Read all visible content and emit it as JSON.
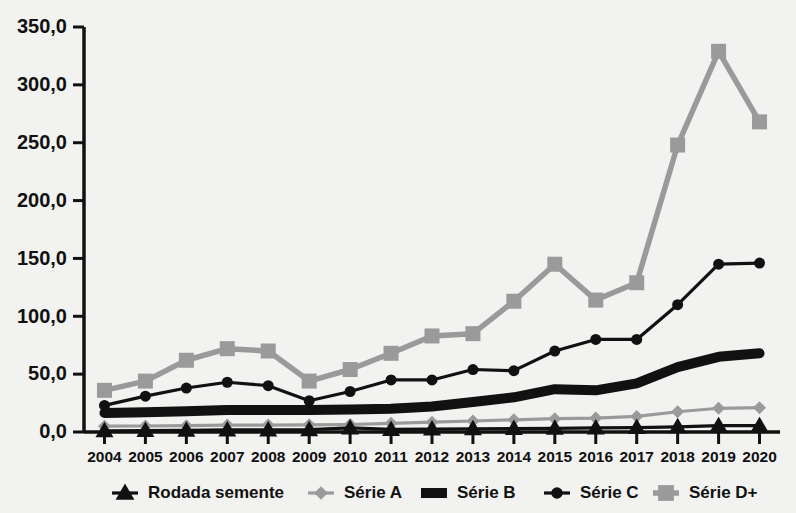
{
  "chart_data": {
    "type": "line",
    "title": "",
    "xlabel": "",
    "ylabel": "",
    "ylim": [
      0,
      350
    ],
    "ytick_labels": [
      "0,0",
      "50,0",
      "100,0",
      "150,0",
      "200,0",
      "250,0",
      "300,0",
      "350,0"
    ],
    "ytick_values": [
      0,
      50,
      100,
      150,
      200,
      250,
      300,
      350
    ],
    "grid": false,
    "legend_position": "bottom",
    "categories": [
      "2004",
      "2005",
      "2006",
      "2007",
      "2008",
      "2009",
      "2010",
      "2011",
      "2012",
      "2013",
      "2014",
      "2015",
      "2016",
      "2017",
      "2018",
      "2019",
      "2020"
    ],
    "series": [
      {
        "name": "Rodada semente",
        "marker": "triangle",
        "color": "#111111",
        "values": [
          1.0,
          1.2,
          1.5,
          1.8,
          1.8,
          2.0,
          3.5,
          2.2,
          2.5,
          2.8,
          3.0,
          3.2,
          3.5,
          3.8,
          4.5,
          5.5,
          5.5
        ]
      },
      {
        "name": "Série A",
        "marker": "diamond",
        "color": "#9a9a9a",
        "values": [
          5.0,
          5.2,
          5.5,
          6.0,
          6.0,
          6.2,
          6.5,
          7.5,
          8.5,
          9.5,
          10.5,
          11.5,
          12.0,
          13.5,
          17.5,
          20.5,
          21.0
        ]
      },
      {
        "name": "Série B",
        "marker": "none",
        "color": "#111111",
        "values": [
          16.5,
          17.0,
          18.0,
          19.0,
          19.0,
          19.0,
          19.5,
          20.0,
          22.0,
          26.0,
          30.0,
          37.0,
          36.0,
          42.0,
          56.0,
          65.0,
          68.0
        ]
      },
      {
        "name": "Série C",
        "marker": "circle",
        "color": "#111111",
        "values": [
          23.0,
          31.0,
          38.0,
          43.0,
          40.0,
          27.0,
          35.0,
          45.0,
          45.0,
          54.0,
          53.0,
          70.0,
          80.0,
          80.0,
          110.0,
          145.0,
          146.0
        ]
      },
      {
        "name": "Série D+",
        "marker": "square",
        "color": "#9a9a9a",
        "values": [
          36.0,
          44.0,
          62.0,
          72.0,
          70.0,
          44.0,
          54.0,
          68.0,
          83.0,
          85.0,
          113.0,
          145.0,
          114.0,
          129.0,
          248.0,
          329.0,
          268.0
        ]
      }
    ]
  },
  "legend": {
    "items": [
      {
        "label": "Rodada semente",
        "icon": "triangle-marker-icon"
      },
      {
        "label": "Série A",
        "icon": "diamond-marker-icon"
      },
      {
        "label": "Série B",
        "icon": "thick-line-icon"
      },
      {
        "label": "Série C",
        "icon": "circle-marker-icon"
      },
      {
        "label": "Série D+",
        "icon": "square-marker-icon"
      }
    ]
  },
  "colors": {
    "dark": "#111111",
    "gray": "#9a9a9a",
    "background": "#f2f2f0"
  }
}
